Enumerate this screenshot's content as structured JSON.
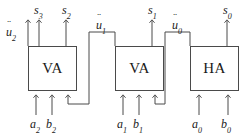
{
  "diagram": {
    "stroke_color": "#4a4a4a",
    "text_color": "#1a1a1a",
    "background": "#ffffff",
    "blocks": [
      {
        "id": "block-2",
        "label": "VA",
        "x": 28,
        "y": 46,
        "w": 49,
        "h": 45,
        "inputs": 3
      },
      {
        "id": "block-1",
        "label": "VA",
        "x": 115,
        "y": 46,
        "w": 49,
        "h": 45,
        "inputs": 3
      },
      {
        "id": "block-0",
        "label": "HA",
        "x": 190,
        "y": 46,
        "w": 49,
        "h": 45,
        "inputs": 2
      }
    ],
    "sum_outputs": [
      {
        "name": "s3",
        "base": "s",
        "sub": "3",
        "x": 34,
        "y": 4
      },
      {
        "name": "s2",
        "base": "s",
        "sub": "2",
        "x": 62,
        "y": 4
      },
      {
        "name": "s1",
        "base": "s",
        "sub": "1",
        "x": 148,
        "y": 4
      },
      {
        "name": "s0",
        "base": "s",
        "sub": "0",
        "x": 223,
        "y": 4
      }
    ],
    "carry_outputs": [
      {
        "name": "u2",
        "base": "u",
        "sub": "2",
        "x": 6,
        "y": 26
      },
      {
        "name": "u1",
        "base": "u",
        "sub": "1",
        "x": 96,
        "y": 19
      },
      {
        "name": "u0",
        "base": "u",
        "sub": "0",
        "x": 172,
        "y": 19
      }
    ],
    "operand_inputs": [
      {
        "name": "a2",
        "base": "a",
        "sub": "2",
        "x": 30,
        "y": 118
      },
      {
        "name": "b2",
        "base": "b",
        "sub": "2",
        "x": 47,
        "y": 118
      },
      {
        "name": "a1",
        "base": "a",
        "sub": "1",
        "x": 117,
        "y": 118
      },
      {
        "name": "b1",
        "base": "b",
        "sub": "1",
        "x": 134,
        "y": 118
      },
      {
        "name": "a0",
        "base": "a",
        "sub": "0",
        "x": 192,
        "y": 118
      },
      {
        "name": "b0",
        "base": "b",
        "sub": "0",
        "x": 222,
        "y": 118
      }
    ]
  }
}
